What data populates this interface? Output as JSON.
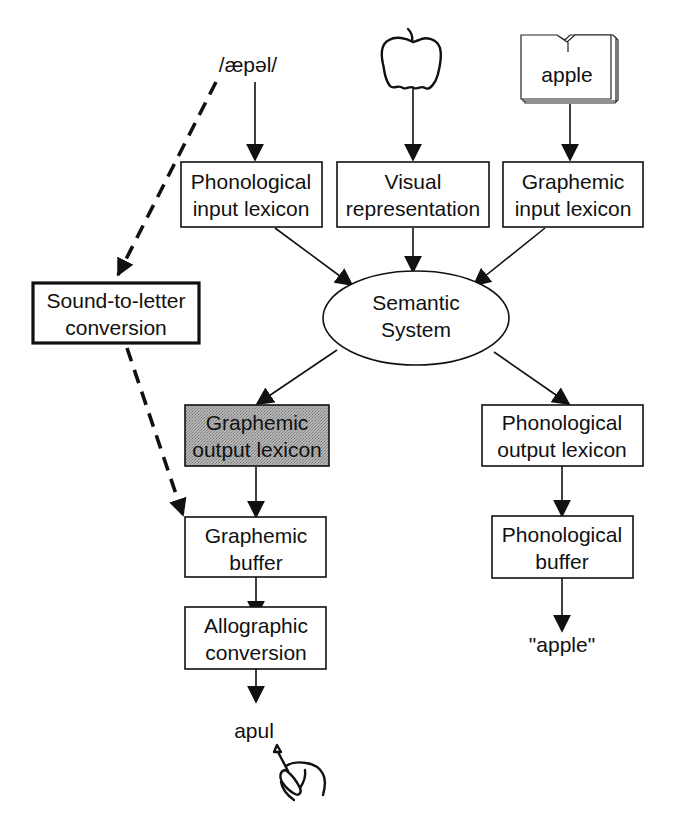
{
  "diagram": {
    "colors": {
      "line": "#111111",
      "box_fill": "#ffffff",
      "shaded_fill": "#a8a8a8"
    },
    "inputs": {
      "spoken": {
        "label": "/æpəl/",
        "kind": "phonological-input-stimulus"
      },
      "picture": {
        "icon": "apple-icon",
        "kind": "picture-stimulus"
      },
      "written": {
        "label": "apple",
        "icon": "book-icon",
        "kind": "written-stimulus"
      }
    },
    "nodes": {
      "phon_input_lexicon": {
        "lines": [
          "Phonological",
          "input lexicon"
        ]
      },
      "visual_representation": {
        "lines": [
          "Visual",
          "representation"
        ]
      },
      "graph_input_lexicon": {
        "lines": [
          "Graphemic",
          "input lexicon"
        ]
      },
      "sound_to_letter": {
        "lines": [
          "Sound-to-letter",
          "conversion"
        ],
        "style": "thick-border"
      },
      "semantic_system": {
        "lines": [
          "Semantic",
          "System"
        ],
        "shape": "ellipse"
      },
      "graph_output_lexicon": {
        "lines": [
          "Graphemic",
          "output lexicon"
        ],
        "style": "shaded"
      },
      "phon_output_lexicon": {
        "lines": [
          "Phonological",
          "output lexicon"
        ]
      },
      "graphemic_buffer": {
        "lines": [
          "Graphemic",
          "buffer"
        ]
      },
      "phonological_buffer": {
        "lines": [
          "Phonological",
          "buffer"
        ]
      },
      "allographic_conversion": {
        "lines": [
          "Allographic",
          "conversion"
        ]
      }
    },
    "outputs": {
      "written": {
        "label": "apul",
        "icon": "writing-hand-icon"
      },
      "spoken": {
        "label": "\"apple\""
      }
    },
    "edges": [
      {
        "from": "spoken_input",
        "to": "phon_input_lexicon",
        "style": "solid"
      },
      {
        "from": "picture_input",
        "to": "visual_representation",
        "style": "solid"
      },
      {
        "from": "written_input",
        "to": "graph_input_lexicon",
        "style": "solid"
      },
      {
        "from": "phon_input_lexicon",
        "to": "semantic_system",
        "style": "solid"
      },
      {
        "from": "visual_representation",
        "to": "semantic_system",
        "style": "solid"
      },
      {
        "from": "graph_input_lexicon",
        "to": "semantic_system",
        "style": "solid"
      },
      {
        "from": "semantic_system",
        "to": "graph_output_lexicon",
        "style": "solid"
      },
      {
        "from": "semantic_system",
        "to": "phon_output_lexicon",
        "style": "solid"
      },
      {
        "from": "graph_output_lexicon",
        "to": "graphemic_buffer",
        "style": "solid"
      },
      {
        "from": "graphemic_buffer",
        "to": "allographic_conversion",
        "style": "solid"
      },
      {
        "from": "allographic_conversion",
        "to": "written_output",
        "style": "solid"
      },
      {
        "from": "phon_output_lexicon",
        "to": "phonological_buffer",
        "style": "solid"
      },
      {
        "from": "phonological_buffer",
        "to": "spoken_output",
        "style": "solid"
      },
      {
        "from": "spoken_input",
        "to": "sound_to_letter",
        "style": "dashed"
      },
      {
        "from": "sound_to_letter",
        "to": "graphemic_buffer",
        "style": "dashed"
      }
    ]
  }
}
